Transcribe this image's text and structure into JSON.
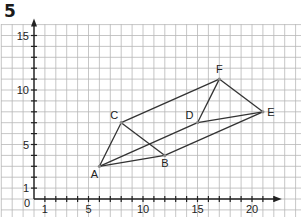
{
  "problem_number": "5",
  "axes": {
    "origin_label": "0",
    "x_tick_labels": [
      {
        "value": 1,
        "label": "1"
      },
      {
        "value": 5,
        "label": "5"
      },
      {
        "value": 10,
        "label": "10"
      },
      {
        "value": 15,
        "label": "15"
      },
      {
        "value": 20,
        "label": "20"
      }
    ],
    "y_tick_labels": [
      {
        "value": 1,
        "label": "1"
      },
      {
        "value": 5,
        "label": "5"
      },
      {
        "value": 10,
        "label": "10"
      },
      {
        "value": 15,
        "label": "15"
      }
    ],
    "x_max": 22,
    "y_max": 16
  },
  "points": [
    {
      "name": "A",
      "x": 6,
      "y": 3
    },
    {
      "name": "B",
      "x": 12,
      "y": 4
    },
    {
      "name": "C",
      "x": 8,
      "y": 7
    },
    {
      "name": "D",
      "x": 15,
      "y": 7
    },
    {
      "name": "E",
      "x": 21,
      "y": 8
    },
    {
      "name": "F",
      "x": 17,
      "y": 11
    }
  ],
  "segments": [
    [
      "A",
      "B"
    ],
    [
      "B",
      "C"
    ],
    [
      "C",
      "A"
    ],
    [
      "D",
      "E"
    ],
    [
      "E",
      "F"
    ],
    [
      "F",
      "D"
    ],
    [
      "A",
      "D"
    ],
    [
      "B",
      "E"
    ],
    [
      "C",
      "F"
    ]
  ],
  "colors": {
    "grid": "#b8b8b8",
    "axis": "#222222",
    "segment": "#333333",
    "point": "#888888"
  }
}
